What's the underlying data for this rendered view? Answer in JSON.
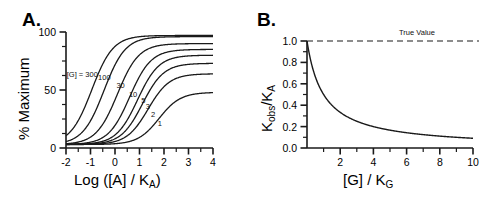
{
  "figure": {
    "background": "#ffffff",
    "line_color": "#1a1a1a",
    "panels": [
      {
        "id": "A",
        "letter": "A."
      },
      {
        "id": "B",
        "letter": "B."
      }
    ]
  },
  "chart_data": [
    {
      "type": "line",
      "panel": "A",
      "panel_letter": "A.",
      "title": "",
      "xlabel": "Log ([A] / K",
      "xlabel_sub": "A",
      "xlabel_tail": ")",
      "xlabel_full": "Log ([A] / KA)",
      "ylabel": "% Maximum",
      "xlim": [
        -2,
        4
      ],
      "ylim": [
        0,
        100
      ],
      "xticks": [
        -2,
        -1,
        0,
        1,
        2,
        3,
        4
      ],
      "xticklabels": [
        "-2",
        "-1",
        "0",
        "1",
        "2",
        "3",
        "4"
      ],
      "yticks": [
        0,
        50,
        100
      ],
      "yticklabels": [
        "0",
        "50",
        "100"
      ],
      "minor_xticks": [
        -1.5,
        -0.5,
        0.5,
        1.5,
        2.5,
        3.5
      ],
      "minor_yticks": [
        12.5,
        25,
        37.5,
        62.5,
        75,
        87.5
      ],
      "grid": false,
      "legend_position": "inline-annotations",
      "legend_prefix": "[G] = ",
      "series": [
        {
          "name": "300",
          "label": "300",
          "ec50_log": -0.95,
          "top": 97.0,
          "bottom": 3.0,
          "hill": 1.0,
          "label_x": -0.62,
          "label_y": 61.0
        },
        {
          "name": "100",
          "label": "100",
          "ec50_log": -0.45,
          "top": 96.0,
          "bottom": 3.0,
          "hill": 1.0,
          "label_x": -0.12,
          "label_y": 59.0
        },
        {
          "name": "30",
          "label": "30",
          "ec50_log": 0.1,
          "top": 90.0,
          "bottom": 3.0,
          "hill": 1.0,
          "label_x": 0.46,
          "label_y": 52.0
        },
        {
          "name": "10",
          "label": "10",
          "ec50_log": 0.6,
          "top": 85.0,
          "bottom": 3.0,
          "hill": 1.0,
          "label_x": 0.97,
          "label_y": 44.0
        },
        {
          "name": "5",
          "label": "5",
          "ec50_log": 0.92,
          "top": 80.0,
          "bottom": 3.0,
          "hill": 1.0,
          "label_x": 1.3,
          "label_y": 39.0
        },
        {
          "name": "3",
          "label": "3",
          "ec50_log": 1.12,
          "top": 73.0,
          "bottom": 3.0,
          "hill": 1.0,
          "label_x": 1.48,
          "label_y": 34.0
        },
        {
          "name": "2",
          "label": "2",
          "ec50_log": 1.35,
          "top": 64.0,
          "bottom": 3.0,
          "hill": 1.0,
          "label_x": 1.7,
          "label_y": 27.0
        },
        {
          "name": "1",
          "label": "1",
          "ec50_log": 1.8,
          "top": 48.0,
          "bottom": 3.0,
          "hill": 1.0,
          "label_x": 1.97,
          "label_y": 19.0
        }
      ]
    },
    {
      "type": "line",
      "panel": "B",
      "panel_letter": "B.",
      "title": "",
      "xlabel": "[G] / K",
      "xlabel_sub": "G",
      "xlabel_full": "[G] / KG",
      "ylabel": "Kobs/KA",
      "ylabel_parts": [
        "K",
        "obs",
        "/K",
        "A"
      ],
      "xlim": [
        0,
        10
      ],
      "ylim": [
        0.0,
        1.0
      ],
      "xticks": [
        2,
        4,
        6,
        8,
        10
      ],
      "xticklabels": [
        "2",
        "4",
        "6",
        "8",
        "10"
      ],
      "yticks": [
        0.0,
        0.2,
        0.4,
        0.6,
        0.8,
        1.0
      ],
      "yticklabels": [
        "0.0",
        "0.2",
        "0.4",
        "0.6",
        "0.8",
        "1.0"
      ],
      "minor_xticks": [
        1,
        3,
        5,
        7,
        9
      ],
      "minor_yticks": [
        0.1,
        0.3,
        0.5,
        0.7,
        0.9
      ],
      "grid": false,
      "annotations": [
        {
          "name": "true-value",
          "text": "True Value",
          "y": 1.0,
          "style": "dashed-horizontal-line",
          "x": 5.6
        }
      ],
      "curve": {
        "name": "Kobs/KA decay",
        "formula": "1/(1+x)",
        "x": [
          0.0,
          0.1,
          0.2,
          0.3,
          0.4,
          0.5,
          0.75,
          1.0,
          1.25,
          1.5,
          2.0,
          2.5,
          3.0,
          3.5,
          4.0,
          5.0,
          6.0,
          7.0,
          8.0,
          9.0,
          10.0
        ],
        "y": [
          1.0,
          0.91,
          0.83,
          0.77,
          0.71,
          0.67,
          0.57,
          0.5,
          0.44,
          0.4,
          0.33,
          0.29,
          0.25,
          0.22,
          0.2,
          0.167,
          0.143,
          0.125,
          0.111,
          0.1,
          0.091
        ]
      }
    }
  ]
}
